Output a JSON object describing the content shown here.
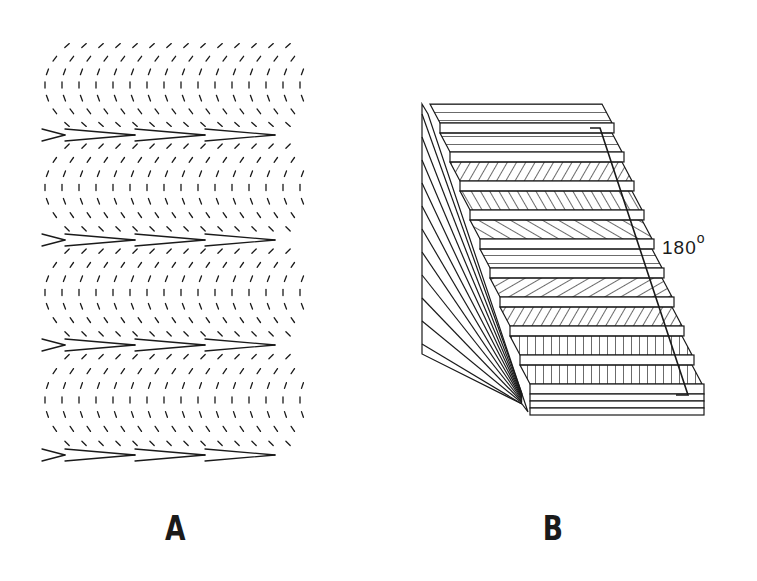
{
  "figure": {
    "panels": [
      {
        "id": "A",
        "label": "A",
        "description": "Field of short line segments arranged in nested bow-shaped arcs; rows of rightward-pointing chevrons separate arc bands",
        "chevron_row_y": [
          135,
          240,
          345,
          455
        ],
        "chevron_apex_x": [
          65,
          135,
          205,
          275
        ],
        "region": {
          "x": 40,
          "y": 35,
          "width": 265,
          "height": 430
        }
      },
      {
        "id": "B",
        "label": "B",
        "description": "Staircase-like stack of thin layers; hatch orientation rotates progressively through the stack",
        "layer_hatch_angles_deg": [
          0,
          -30,
          30,
          60,
          90,
          120,
          150,
          180
        ],
        "bracket_label": "180",
        "bracket_superscript": "o",
        "region": {
          "x": 420,
          "y": 100,
          "width": 275,
          "height": 325
        }
      }
    ],
    "colors": {
      "ink": "#1a1a1a",
      "background": "#ffffff"
    }
  }
}
